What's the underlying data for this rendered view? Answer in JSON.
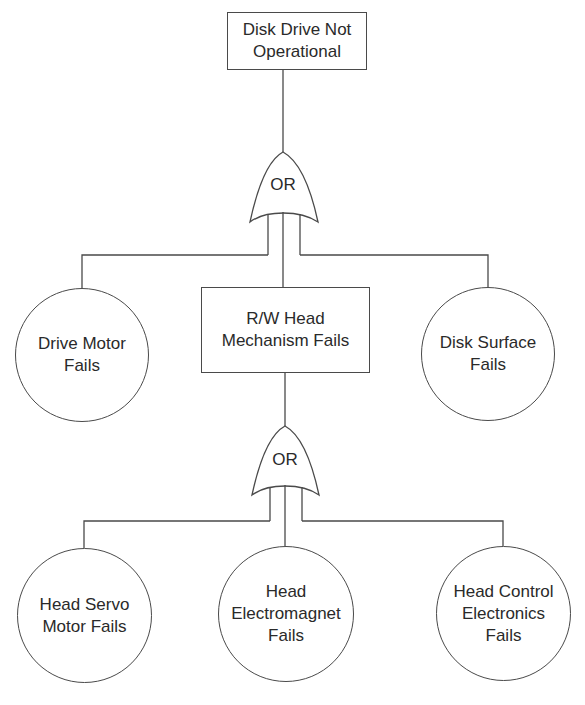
{
  "diagram": {
    "type": "fault-tree",
    "top_event": {
      "label": "Disk Drive Not\nOperational",
      "shape": "rectangle"
    },
    "gates": [
      {
        "id": "gate1",
        "type": "OR",
        "label": "OR",
        "parent": "top_event"
      },
      {
        "id": "gate2",
        "type": "OR",
        "label": "OR",
        "parent": "intermediate_event"
      }
    ],
    "intermediate_event": {
      "label": "R/W Head\nMechanism Fails",
      "shape": "rectangle"
    },
    "basic_events_level1": [
      {
        "label": "Drive Motor\nFails",
        "shape": "circle"
      },
      {
        "label": "Disk Surface\nFails",
        "shape": "circle"
      }
    ],
    "basic_events_level2": [
      {
        "label": "Head Servo\nMotor Fails",
        "shape": "circle"
      },
      {
        "label": "Head\nElectromagnet\nFails",
        "shape": "circle"
      },
      {
        "label": "Head Control\nElectronics\nFails",
        "shape": "circle"
      }
    ],
    "colors": {
      "line": "#4a4a4a",
      "text": "#2a2a2a",
      "background": "#ffffff"
    }
  }
}
